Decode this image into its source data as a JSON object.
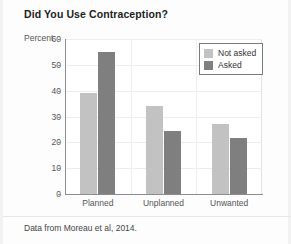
{
  "chart_data": {
    "type": "bar",
    "title": "Did You Use Contraception?",
    "xlabel": "",
    "ylabel": "Percent",
    "ylim": [
      0,
      60
    ],
    "yticks": [
      0,
      10,
      20,
      30,
      40,
      50,
      60
    ],
    "grid": true,
    "legend_position": "top-right",
    "categories": [
      "Planned",
      "Unplanned",
      "Unwanted"
    ],
    "series": [
      {
        "name": "Not asked",
        "color": "#c2c2c2",
        "values": [
          39,
          34,
          27
        ]
      },
      {
        "name": "Asked",
        "color": "#7f7f7f",
        "values": [
          55,
          24.5,
          21.5
        ]
      }
    ],
    "source_note": "Data from Moreau et al, 2014."
  },
  "colors": {
    "not_asked": "#c2c2c2",
    "asked": "#7f7f7f",
    "axis": "#8d8d8d",
    "grid": "#ededed",
    "title": "#222222",
    "text": "#555555",
    "background": "#fdfdfd"
  }
}
